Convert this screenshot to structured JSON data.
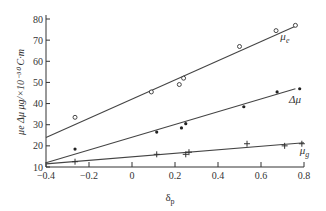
{
  "chart_data": {
    "type": "scatter",
    "title": "",
    "xlabel": "δp",
    "ylabel": "μe Δμ μg/×10⁻³⁰ C·m",
    "xlim": [
      -0.4,
      0.8
    ],
    "ylim": [
      10,
      80
    ],
    "grid": false,
    "x_ticks": [
      "-0.4",
      "-0.2",
      "0",
      "0.2",
      "0.4",
      "0.6",
      "0.8"
    ],
    "y_ticks": [
      "10",
      "20",
      "30",
      "40",
      "50",
      "60",
      "70",
      "80"
    ],
    "series": [
      {
        "name": "μe",
        "marker": "open-circle",
        "points": [
          [
            -0.265,
            33.5
          ],
          [
            0.09,
            45.5
          ],
          [
            0.22,
            49
          ],
          [
            0.24,
            52
          ],
          [
            0.5,
            67
          ],
          [
            0.67,
            74.5
          ],
          [
            0.76,
            77
          ]
        ],
        "fit_line": [
          [
            -0.4,
            24
          ],
          [
            0.77,
            77
          ]
        ],
        "label_pos": [
          0.69,
          70
        ]
      },
      {
        "name": "Δμ",
        "marker": "filled-dot",
        "points": [
          [
            -0.265,
            18.5
          ],
          [
            0.115,
            26.5
          ],
          [
            0.23,
            28.5
          ],
          [
            0.25,
            30.5
          ],
          [
            0.52,
            38.5
          ],
          [
            0.675,
            45.5
          ],
          [
            0.78,
            47
          ]
        ],
        "fit_line": [
          [
            -0.4,
            12
          ],
          [
            0.76,
            47
          ]
        ],
        "label_pos": [
          0.73,
          40.5
        ]
      },
      {
        "name": "μg",
        "marker": "plus",
        "points": [
          [
            -0.265,
            12.5
          ],
          [
            0.115,
            16
          ],
          [
            0.25,
            16
          ],
          [
            0.265,
            17
          ],
          [
            0.535,
            21
          ],
          [
            0.71,
            20
          ],
          [
            0.79,
            21
          ]
        ],
        "fit_line": [
          [
            -0.4,
            11.5
          ],
          [
            0.8,
            21.5
          ]
        ],
        "label_pos": [
          0.78,
          16
        ]
      }
    ]
  },
  "labels": {
    "ylabel": "μe Δμ μg/×10⁻³⁰ C·m",
    "xlabel_main": "δ",
    "xlabel_sub": "p",
    "series_labels": [
      {
        "main": "μ",
        "sub": "e"
      },
      {
        "main": "Δμ",
        "sub": ""
      },
      {
        "main": "μ",
        "sub": "g"
      }
    ]
  }
}
